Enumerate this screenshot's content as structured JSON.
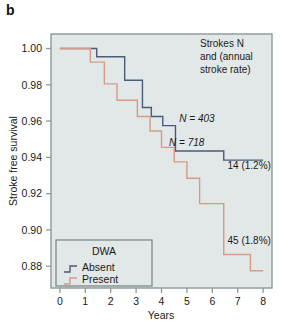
{
  "panel": {
    "label": "b"
  },
  "chart_data": {
    "type": "line",
    "subtype": "kaplan-meier-step",
    "title": "",
    "xlabel": "Years",
    "ylabel": "Stroke free survival",
    "xlim": [
      -0.35,
      8.35
    ],
    "ylim": [
      0.868,
      1.008
    ],
    "xticks": [
      0,
      1,
      2,
      3,
      4,
      5,
      6,
      7,
      8
    ],
    "xtick_labels": [
      "0",
      "1",
      "2",
      "3",
      "4",
      "5",
      "6",
      "7",
      "8"
    ],
    "yticks": [
      0.88,
      0.9,
      0.92,
      0.94,
      0.96,
      0.98,
      1.0
    ],
    "ytick_labels": [
      "0.88",
      "0.90",
      "0.92",
      "0.94",
      "0.96",
      "0.98",
      "1.00"
    ],
    "grid": false,
    "plot_background": "#e2e8e8",
    "legend": {
      "position": "bottom-left",
      "title": "DWA",
      "entries": [
        {
          "label": "Absent",
          "color": "#4a5a7a"
        },
        {
          "label": "Present",
          "color": "#d69a86"
        }
      ]
    },
    "series": [
      {
        "name": "Absent",
        "legend_label": "Absent",
        "color": "#4a5a7a",
        "n_label": "N = 403",
        "endpoint_label": "14 (1.2%)",
        "x": [
          0.0,
          1.45,
          1.45,
          2.55,
          2.55,
          3.25,
          3.25,
          3.6,
          3.6,
          4.05,
          4.05,
          4.55,
          4.55,
          6.45,
          6.45,
          8.0
        ],
        "y": [
          1.0,
          1.0,
          0.9955,
          0.9955,
          0.9825,
          0.9825,
          0.9675,
          0.9675,
          0.9625,
          0.9625,
          0.9575,
          0.9575,
          0.9435,
          0.9435,
          0.9385,
          0.9385
        ]
      },
      {
        "name": "Present",
        "legend_label": "Present",
        "color": "#d69a86",
        "n_label": "N = 718",
        "endpoint_label": "45 (1.8%)",
        "x": [
          0.0,
          1.2,
          1.2,
          1.75,
          1.75,
          2.25,
          2.25,
          3.05,
          3.05,
          3.55,
          3.55,
          4.0,
          4.0,
          4.5,
          4.5,
          5.0,
          5.0,
          5.5,
          5.5,
          6.45,
          6.45,
          7.5,
          7.5,
          8.0
        ],
        "y": [
          1.0,
          1.0,
          0.9925,
          0.9925,
          0.9805,
          0.9805,
          0.9715,
          0.9715,
          0.9625,
          0.9625,
          0.9545,
          0.9545,
          0.9455,
          0.9455,
          0.9375,
          0.9375,
          0.9285,
          0.9285,
          0.9145,
          0.9145,
          0.8865,
          0.8865,
          0.8775,
          0.8775
        ]
      }
    ],
    "annotations": [
      {
        "id": "header-note",
        "text_lines": [
          "Strokes N",
          "and (annual",
          "stroke rate)"
        ],
        "position": "top-right"
      },
      {
        "id": "n-absent",
        "text": "N = 403",
        "x": 4.7,
        "y": 0.9595
      },
      {
        "id": "n-present",
        "text": "N = 718",
        "x": 4.3,
        "y": 0.9465
      },
      {
        "id": "end-absent",
        "text": "14 (1.2%)",
        "x": 6.6,
        "y": 0.9335
      },
      {
        "id": "end-present",
        "text": "45 (1.8%)",
        "x": 6.6,
        "y": 0.8925
      }
    ]
  }
}
